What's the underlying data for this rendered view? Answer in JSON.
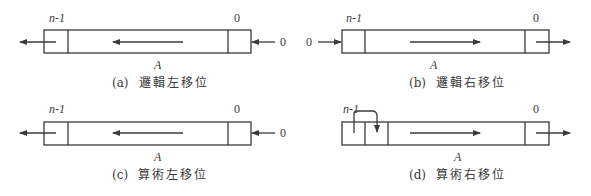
{
  "panels": [
    {
      "id": "a",
      "caption_tag": "(a)",
      "caption_text": "邏輯左移位",
      "msb_label": "n-1",
      "lsb_label": "0",
      "register_label": "A",
      "input_value": "0",
      "input_side": "right",
      "output_side": "left",
      "shift_direction": "left"
    },
    {
      "id": "b",
      "caption_tag": "(b)",
      "caption_text": "邏輯右移位",
      "msb_label": "n-1",
      "lsb_label": "0",
      "register_label": "A",
      "input_value": "0",
      "input_side": "left",
      "output_side": "right",
      "shift_direction": "right"
    },
    {
      "id": "c",
      "caption_tag": "(c)",
      "caption_text": "算術左移位",
      "msb_label": "n-1",
      "lsb_label": "0",
      "register_label": "A",
      "input_value": "0",
      "input_side": "right",
      "output_side": "left",
      "shift_direction": "left"
    },
    {
      "id": "d",
      "caption_tag": "(d)",
      "caption_text": "算術右移位",
      "msb_label": "n-1",
      "lsb_label": "0",
      "register_label": "A",
      "input_value": "",
      "input_side": "sign-bit-copy",
      "output_side": "right",
      "shift_direction": "right"
    }
  ],
  "colors": {
    "line": "#3a3a3a",
    "background": "#ffffff"
  }
}
